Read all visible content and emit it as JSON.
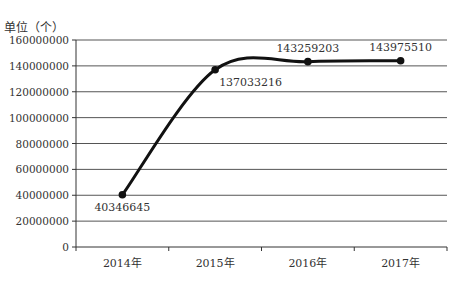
{
  "chart_data": {
    "type": "line",
    "title": "",
    "unit_label": "单位（个）",
    "xlabel": "",
    "ylabel": "单位（个）",
    "categories": [
      "2014年",
      "2015年",
      "2016年",
      "2017年"
    ],
    "series": [
      {
        "name": "",
        "values": [
          40346645,
          137033216,
          143259203,
          143975510
        ]
      }
    ],
    "data_labels": [
      "40346645",
      "137033216",
      "143259203",
      "143975510"
    ],
    "y_ticks": [
      0,
      20000000,
      40000000,
      60000000,
      80000000,
      100000000,
      120000000,
      140000000,
      160000000
    ],
    "ylim": [
      0,
      160000000
    ],
    "grid": true,
    "smooth": true,
    "legend": "none",
    "line_color": "#111111",
    "grid_color": "#555555"
  }
}
